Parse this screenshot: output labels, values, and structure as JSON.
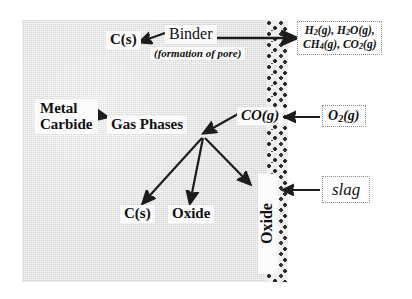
{
  "diagram": {
    "substrate": {
      "name": "metal-carbide-substrate",
      "fill_color": "#d2d2d2"
    },
    "scale_band": {
      "name": "speckled-oxide-scale-band",
      "fill_color": "#2b2b2b"
    },
    "nodes": {
      "c_solid_top": "C(s)",
      "binder": "Binder",
      "formation_note": "(formation of pore)",
      "metal_carbide_line1": "Metal",
      "metal_carbide_line2": "Carbide",
      "gas_phases": "Gas Phases",
      "co_gas": "CO(g)",
      "oxide_layer_label": "Oxide",
      "c_solid_bottom": "C(s)",
      "oxide_product": "Oxide"
    },
    "external_boxes": {
      "gas_products_line1": "H2(g), H2O(g),",
      "gas_products_line2": "CH4(g), CO2(g)",
      "oxygen": "O2(g)",
      "slag": "slag"
    }
  }
}
